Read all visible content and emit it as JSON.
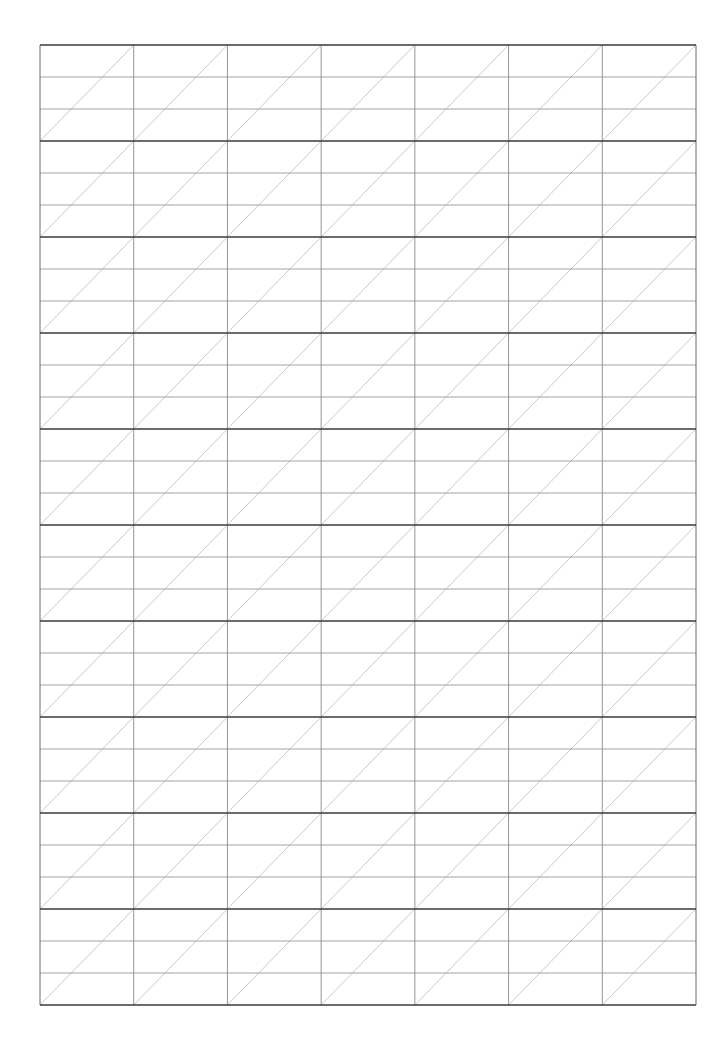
{
  "page": {
    "width": 728,
    "height": 1051,
    "background": "#ffffff"
  },
  "grid": {
    "type": "calligraphy-practice-grid",
    "left": 40,
    "top": 45,
    "right": 696,
    "bottom": 1005,
    "columns": 7,
    "rows": 10,
    "bands_per_row": 3,
    "diagonal_direction": "bottom-left-to-top-right",
    "colors": {
      "row_border": "#3a3a3a",
      "band_line": "#9a9a9a",
      "column_line": "#8a8a8a",
      "diagonal": "#bdbdbd",
      "frame": "#6a6a6a"
    },
    "stroke_widths": {
      "row_border": 1.6,
      "band_line": 0.9,
      "column_line": 0.9,
      "diagonal": 0.8,
      "frame": 1
    }
  }
}
